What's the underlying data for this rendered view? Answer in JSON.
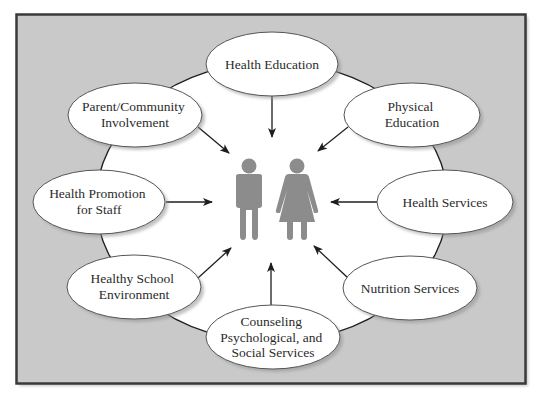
{
  "diagram": {
    "title": "",
    "center_label": "Student (male and female figures)",
    "colors": {
      "frame_border": "#3a3a3a",
      "frame_fill": "#c9c9c9",
      "hub_fill": "#ffffff",
      "node_fill": "#ffffff",
      "node_stroke": "#555555",
      "node_shadow": "#9a9a9a",
      "arrow": "#1e1e1e",
      "figure": "#8c8c8c",
      "text": "#2b2b2b"
    },
    "nodes": [
      {
        "id": "health-education",
        "lines": [
          "Health Education"
        ]
      },
      {
        "id": "physical-education",
        "lines": [
          "Physical",
          "Education"
        ]
      },
      {
        "id": "health-services",
        "lines": [
          "Health Services"
        ]
      },
      {
        "id": "nutrition-services",
        "lines": [
          "Nutrition Services"
        ]
      },
      {
        "id": "counseling",
        "lines": [
          "Counseling",
          "Psychological, and",
          "Social Services"
        ]
      },
      {
        "id": "healthy-school-environment",
        "lines": [
          "Healthy School",
          "Environment"
        ]
      },
      {
        "id": "health-promotion-staff",
        "lines": [
          "Health Promotion",
          "for Staff"
        ]
      },
      {
        "id": "parent-community",
        "lines": [
          "Parent/Community",
          "Involvement"
        ]
      }
    ],
    "edges": [
      {
        "from": "health-education",
        "to": "center"
      },
      {
        "from": "physical-education",
        "to": "center"
      },
      {
        "from": "health-services",
        "to": "center"
      },
      {
        "from": "nutrition-services",
        "to": "center"
      },
      {
        "from": "counseling",
        "to": "center"
      },
      {
        "from": "healthy-school-environment",
        "to": "center"
      },
      {
        "from": "health-promotion-staff",
        "to": "center"
      },
      {
        "from": "parent-community",
        "to": "center"
      }
    ]
  }
}
